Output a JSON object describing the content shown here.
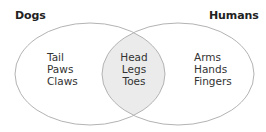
{
  "diagram": {
    "type": "venn",
    "sets": [
      {
        "title": "Dogs",
        "only_items": [
          "Tail",
          "Paws",
          "Claws"
        ]
      },
      {
        "title": "Humans",
        "only_items": [
          "Arms",
          "Hands",
          "Fingers"
        ]
      }
    ],
    "intersection": {
      "items": [
        "Head",
        "Legs",
        "Toes"
      ]
    },
    "colors": {
      "stroke": "#b3b3b3",
      "intersection_fill": "#ebebeb",
      "background": "#ffffff",
      "text": "#333333",
      "title_text": "#222222"
    }
  }
}
